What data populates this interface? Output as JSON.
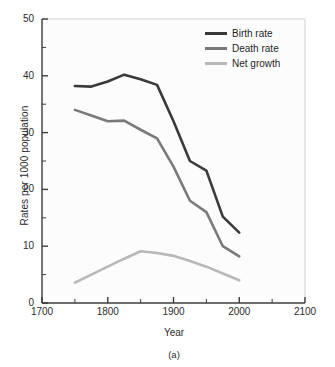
{
  "chart_data": {
    "type": "line",
    "title": "",
    "caption": "(a)",
    "xlabel": "Year",
    "ylabel": "Rates per 1000 population",
    "xlim": [
      1700,
      2100
    ],
    "ylim": [
      0,
      50
    ],
    "xticks": [
      1700,
      1800,
      1900,
      2000,
      2100
    ],
    "xtick_labels": [
      "1700",
      "1800",
      "1900",
      "2000",
      "2100"
    ],
    "xminor_ticks": [
      1750,
      1850,
      1950,
      2050
    ],
    "yticks": [
      0,
      10,
      20,
      30,
      40,
      50
    ],
    "ytick_labels": [
      "0",
      "10",
      "20",
      "30",
      "40",
      "50"
    ],
    "yminor_ticks": [
      5,
      15,
      25,
      35,
      45
    ],
    "grid": false,
    "legend_position": "top-right",
    "series": [
      {
        "name": "Birth rate",
        "color": "#3a3a3a",
        "x": [
          1750,
          1775,
          1800,
          1825,
          1850,
          1875,
          1900,
          1925,
          1950,
          1975,
          2000
        ],
        "values": [
          38.2,
          38.1,
          39.0,
          40.2,
          39.4,
          38.4,
          32.0,
          25.0,
          23.3,
          15.2,
          12.4
        ]
      },
      {
        "name": "Death rate",
        "color": "#7a7a7a",
        "x": [
          1750,
          1775,
          1800,
          1825,
          1850,
          1875,
          1900,
          1925,
          1950,
          1975,
          2000
        ],
        "values": [
          34.0,
          33.0,
          32.0,
          32.1,
          30.5,
          29.0,
          24.0,
          18.0,
          16.0,
          10.0,
          8.2
        ]
      },
      {
        "name": "Net growth",
        "color": "#b8b8b8",
        "x": [
          1750,
          1775,
          1800,
          1825,
          1850,
          1875,
          1900,
          1925,
          1950,
          1975,
          2000
        ],
        "values": [
          3.6,
          5.0,
          6.4,
          7.8,
          9.1,
          8.8,
          8.3,
          7.4,
          6.4,
          5.2,
          4.0
        ]
      }
    ]
  },
  "legend": {
    "items": [
      {
        "label": "Birth rate",
        "color": "#3a3a3a"
      },
      {
        "label": "Death rate",
        "color": "#7a7a7a"
      },
      {
        "label": "Net growth",
        "color": "#b8b8b8"
      }
    ]
  },
  "axes": {
    "axis_color": "#3c3c3c",
    "frame_color": "#d2d2d2",
    "plot_background": "#fcfcfc"
  }
}
